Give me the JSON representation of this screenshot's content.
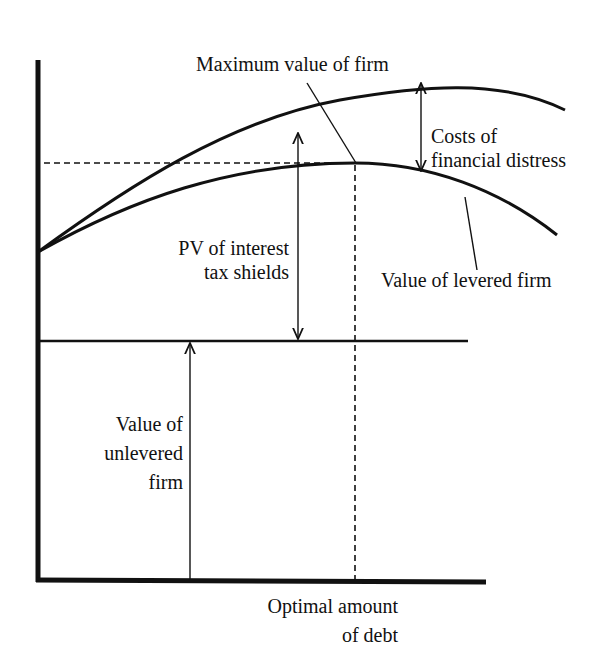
{
  "diagram": {
    "labels": {
      "max_value": "Maximum value of firm",
      "costs_distress_line1": "Costs of",
      "costs_distress_line2": "financial distress",
      "pv_tax_line1": "PV of interest",
      "pv_tax_line2": "tax shields",
      "levered_firm": "Value of levered firm",
      "unlevered_line1": "Value of",
      "unlevered_line2": "unlevered",
      "unlevered_line3": "firm",
      "optimal_line1": "Optimal amount",
      "optimal_line2": "of debt"
    },
    "elements": {
      "y_axis": "Firm value",
      "x_axis": "Debt",
      "upper_curve": "Value of all-equity firm plus PV of tax shields",
      "lower_curve": "Value of levered firm",
      "unlevered_line": "Value of unlevered firm (constant)",
      "optimal_marker": "Optimal amount of debt (dashed)"
    },
    "colors": {
      "ink": "#111111",
      "background": "#ffffff"
    }
  }
}
